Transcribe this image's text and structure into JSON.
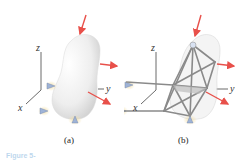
{
  "figure": {
    "panels": [
      {
        "id": "a",
        "caption": "(a)",
        "description": "rigid body with ball-and-socket supports and applied forces",
        "axes": {
          "x": "x",
          "y": "y",
          "z": "z"
        }
      },
      {
        "id": "b",
        "caption": "(b)",
        "description": "equivalent space-truss idealization of the body",
        "axes": {
          "x": "x",
          "y": "y",
          "z": "z"
        }
      }
    ],
    "figure_caption_partial": "Figure 5-",
    "colors": {
      "force_arrow": "#e8504a",
      "body_fill": "#eeeeee",
      "truss_member": "#8a8a8a",
      "support": "#9fb3d6",
      "support_glow": "#f3dfa6",
      "axis": "#444444"
    }
  }
}
